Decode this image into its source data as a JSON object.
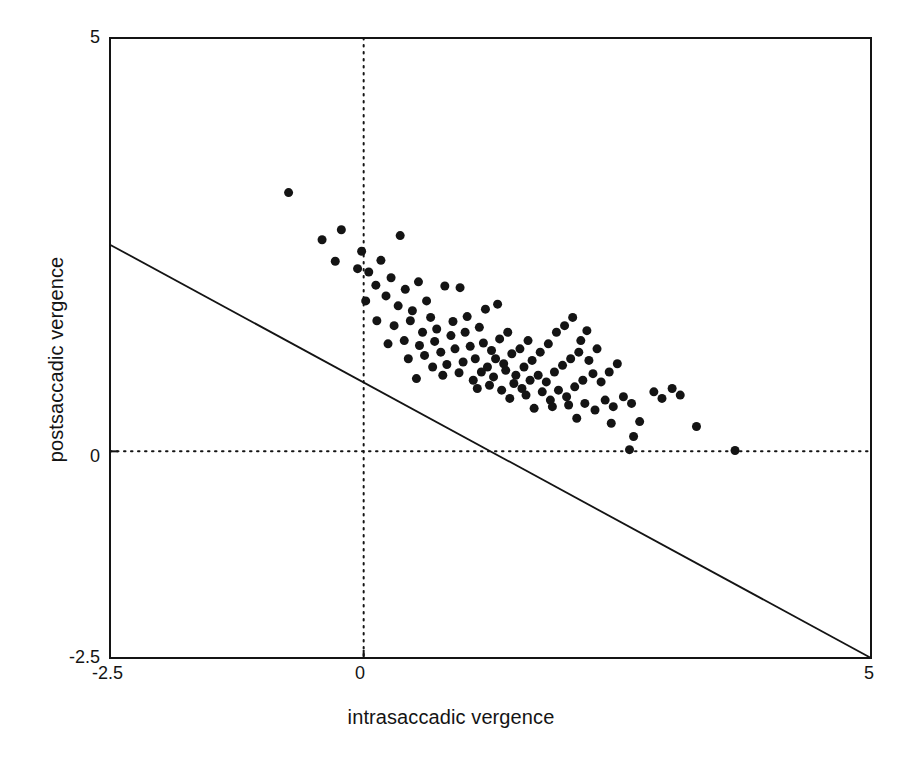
{
  "figure": {
    "kind": "scatter-plot",
    "background": "#ffffff",
    "ink_color": "#141414",
    "marker_color": "#141414"
  },
  "chart_data": {
    "type": "scatter",
    "title": "",
    "xlabel": "intrasaccadic vergence",
    "ylabel": "postsaccadic vergence",
    "xlim": [
      -2.5,
      5
    ],
    "ylim": [
      -2.5,
      5
    ],
    "xticks": [
      -2.5,
      0,
      5
    ],
    "xtick_labels": [
      "-2.5",
      "0",
      "5"
    ],
    "yticks": [
      -2.5,
      0,
      5
    ],
    "ytick_labels": [
      "-2.5",
      "0",
      "5"
    ],
    "grid": false,
    "reference_lines": [
      {
        "name": "unity-negative-diagonal",
        "style": "solid",
        "equation": "y = -x",
        "from": [
          -2.5,
          2.5
        ],
        "to": [
          5,
          -5
        ],
        "clipped_from": [
          -2.5,
          2.5
        ],
        "clipped_to": [
          5.0,
          -2.5
        ]
      },
      {
        "name": "zero-horizontal",
        "style": "dotted",
        "y": 0
      },
      {
        "name": "zero-vertical",
        "style": "dotted",
        "x": 0
      }
    ],
    "marker": {
      "shape": "circle",
      "size_px": 9,
      "filled": true
    },
    "n_points": 118,
    "points": [
      [
        -0.74,
        3.13
      ],
      [
        -0.22,
        2.68
      ],
      [
        -0.41,
        2.56
      ],
      [
        -0.28,
        2.3
      ],
      [
        -0.02,
        2.42
      ],
      [
        -0.06,
        2.21
      ],
      [
        0.05,
        2.17
      ],
      [
        0.17,
        2.31
      ],
      [
        0.36,
        2.61
      ],
      [
        0.27,
        2.1
      ],
      [
        0.12,
        2.01
      ],
      [
        0.02,
        1.82
      ],
      [
        0.22,
        1.88
      ],
      [
        0.41,
        1.96
      ],
      [
        0.34,
        1.76
      ],
      [
        0.54,
        2.05
      ],
      [
        0.48,
        1.7
      ],
      [
        0.62,
        1.82
      ],
      [
        0.13,
        1.58
      ],
      [
        0.3,
        1.52
      ],
      [
        0.46,
        1.58
      ],
      [
        0.66,
        1.62
      ],
      [
        0.8,
        2.0
      ],
      [
        0.95,
        1.98
      ],
      [
        0.58,
        1.44
      ],
      [
        0.72,
        1.48
      ],
      [
        0.88,
        1.57
      ],
      [
        1.02,
        1.63
      ],
      [
        0.24,
        1.3
      ],
      [
        0.4,
        1.34
      ],
      [
        0.55,
        1.28
      ],
      [
        0.7,
        1.33
      ],
      [
        0.86,
        1.4
      ],
      [
        1.0,
        1.44
      ],
      [
        1.14,
        1.5
      ],
      [
        1.2,
        1.72
      ],
      [
        1.32,
        1.78
      ],
      [
        0.44,
        1.12
      ],
      [
        0.6,
        1.16
      ],
      [
        0.76,
        1.2
      ],
      [
        0.9,
        1.24
      ],
      [
        1.05,
        1.27
      ],
      [
        1.18,
        1.31
      ],
      [
        1.26,
        1.22
      ],
      [
        1.34,
        1.36
      ],
      [
        1.42,
        1.44
      ],
      [
        0.68,
        1.02
      ],
      [
        0.82,
        1.05
      ],
      [
        0.98,
        1.08
      ],
      [
        1.1,
        1.12
      ],
      [
        1.22,
        1.02
      ],
      [
        1.3,
        1.12
      ],
      [
        1.38,
        1.06
      ],
      [
        1.46,
        1.18
      ],
      [
        1.54,
        1.24
      ],
      [
        1.62,
        1.34
      ],
      [
        0.52,
        0.88
      ],
      [
        0.78,
        0.92
      ],
      [
        0.94,
        0.95
      ],
      [
        1.08,
        0.86
      ],
      [
        1.16,
        0.96
      ],
      [
        1.28,
        0.9
      ],
      [
        1.4,
        0.98
      ],
      [
        1.5,
        0.92
      ],
      [
        1.58,
        1.02
      ],
      [
        1.66,
        1.1
      ],
      [
        1.74,
        1.2
      ],
      [
        1.82,
        1.3
      ],
      [
        1.9,
        1.44
      ],
      [
        1.98,
        1.52
      ],
      [
        2.06,
        1.62
      ],
      [
        2.14,
        1.34
      ],
      [
        2.2,
        1.46
      ],
      [
        1.12,
        0.76
      ],
      [
        1.24,
        0.8
      ],
      [
        1.36,
        0.74
      ],
      [
        1.48,
        0.82
      ],
      [
        1.56,
        0.76
      ],
      [
        1.64,
        0.86
      ],
      [
        1.72,
        0.92
      ],
      [
        1.8,
        0.84
      ],
      [
        1.88,
        0.96
      ],
      [
        1.96,
        1.04
      ],
      [
        2.04,
        1.12
      ],
      [
        2.12,
        1.2
      ],
      [
        2.22,
        1.1
      ],
      [
        2.3,
        1.24
      ],
      [
        1.44,
        0.64
      ],
      [
        1.6,
        0.68
      ],
      [
        1.76,
        0.72
      ],
      [
        1.84,
        0.62
      ],
      [
        1.92,
        0.74
      ],
      [
        2.0,
        0.66
      ],
      [
        2.08,
        0.78
      ],
      [
        2.16,
        0.86
      ],
      [
        2.26,
        0.94
      ],
      [
        2.34,
        0.84
      ],
      [
        2.42,
        0.96
      ],
      [
        2.5,
        1.06
      ],
      [
        1.68,
        0.52
      ],
      [
        1.86,
        0.54
      ],
      [
        2.02,
        0.56
      ],
      [
        2.18,
        0.58
      ],
      [
        2.28,
        0.5
      ],
      [
        2.38,
        0.62
      ],
      [
        2.46,
        0.54
      ],
      [
        2.56,
        0.66
      ],
      [
        2.64,
        0.58
      ],
      [
        2.86,
        0.72
      ],
      [
        2.94,
        0.64
      ],
      [
        3.04,
        0.76
      ],
      [
        3.12,
        0.68
      ],
      [
        2.1,
        0.4
      ],
      [
        2.44,
        0.34
      ],
      [
        2.72,
        0.36
      ],
      [
        2.66,
        0.18
      ],
      [
        3.28,
        0.3
      ],
      [
        2.62,
        0.02
      ],
      [
        3.66,
        0.01
      ]
    ]
  }
}
